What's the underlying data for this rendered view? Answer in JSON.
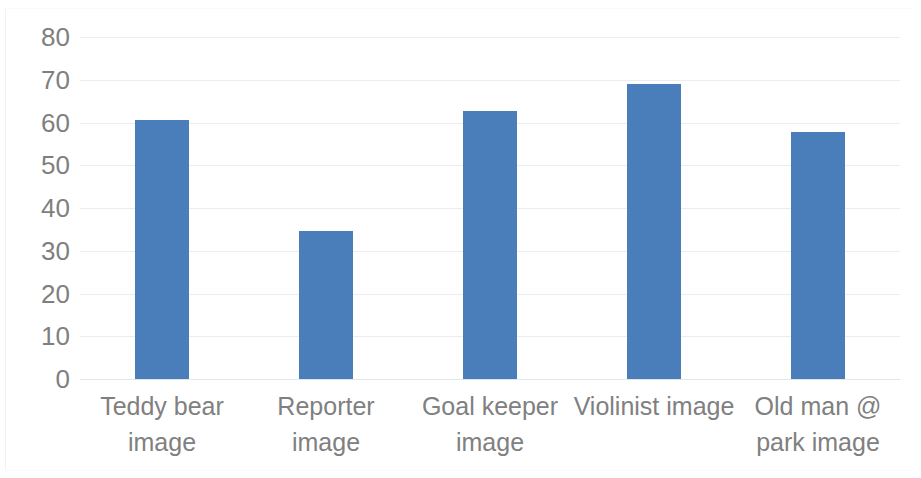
{
  "chart_data": {
    "type": "bar",
    "title": "",
    "subtitle": "",
    "xlabel": "",
    "ylabel": "",
    "categories": [
      "Teddy bear image",
      "Reporter image",
      "Goal keeper image",
      "Violinist image",
      "Old man @ park image"
    ],
    "category_lines": [
      [
        "Teddy bear",
        "image"
      ],
      [
        "Reporter",
        "image"
      ],
      [
        "Goal keeper",
        "image"
      ],
      [
        "Violinist image"
      ],
      [
        "Old man @",
        "park image"
      ]
    ],
    "values": [
      60.7,
      34.6,
      62.6,
      69.1,
      57.8
    ],
    "ylim": [
      0,
      80
    ],
    "ytick_labels": [
      "80",
      "70",
      "60",
      "50",
      "40",
      "30",
      "20",
      "10",
      "0"
    ],
    "ytick_values": [
      80,
      70,
      60,
      50,
      40,
      30,
      20,
      10,
      0
    ],
    "grid": true,
    "legend": false,
    "legend_position": "none",
    "bar_color": "#4a7ebb",
    "gridline_color": "#e8eef0",
    "tick_label_color": "#7f7f7f",
    "category_label_color": "#808080",
    "background_color": "#ffffff"
  }
}
